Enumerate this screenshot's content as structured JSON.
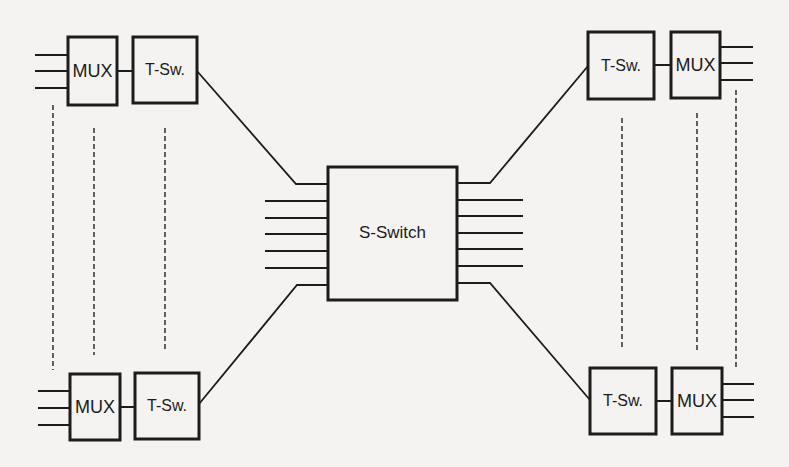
{
  "diagram": {
    "type": "time-space switching network",
    "colors": {
      "background": "#f4f3f1",
      "stroke": "#1c1c1c",
      "dashed": "#3a3a3a"
    },
    "center_switch": {
      "label": "S-Switch",
      "x": 328,
      "y": 167,
      "w": 129,
      "h": 133,
      "left_lines_y": [
        201,
        218,
        234,
        251,
        268
      ],
      "right_lines_y": [
        200,
        216,
        233,
        249,
        266
      ],
      "left_line_x0": 265,
      "right_line_x1": 523
    },
    "stages": [
      {
        "id": "top-left",
        "mux": {
          "label": "MUX",
          "x": 68,
          "y": 37,
          "w": 49,
          "h": 68
        },
        "tsw": {
          "label": "T-Sw.",
          "x": 133,
          "y": 37,
          "w": 64,
          "h": 66
        },
        "io_lines_y": [
          55,
          71,
          88
        ],
        "io_x0": 35,
        "io_x1": 68,
        "link": {
          "points": "197,71 296,184 328,184"
        }
      },
      {
        "id": "top-right",
        "tsw": {
          "label": "T-Sw.",
          "x": 588,
          "y": 32,
          "w": 66,
          "h": 67
        },
        "mux": {
          "label": "MUX",
          "x": 671,
          "y": 32,
          "w": 49,
          "h": 66
        },
        "io_lines_y": [
          47,
          63,
          80
        ],
        "io_x0": 720,
        "io_x1": 753,
        "link": {
          "points": "588,66 490,183 457,183"
        }
      },
      {
        "id": "bottom-left",
        "mux": {
          "label": "MUX",
          "x": 70,
          "y": 374,
          "w": 50,
          "h": 66
        },
        "tsw": {
          "label": "T-Sw.",
          "x": 135,
          "y": 373,
          "w": 64,
          "h": 66
        },
        "io_lines_y": [
          391,
          408,
          425
        ],
        "io_x0": 38,
        "io_x1": 70,
        "link": {
          "points": "199,404 297,285 328,285"
        }
      },
      {
        "id": "bottom-right",
        "tsw": {
          "label": "T-Sw.",
          "x": 590,
          "y": 368,
          "w": 66,
          "h": 66
        },
        "mux": {
          "label": "MUX",
          "x": 672,
          "y": 368,
          "w": 50,
          "h": 66
        },
        "io_lines_y": [
          384,
          400,
          417
        ],
        "io_x0": 722,
        "io_x1": 754,
        "link": {
          "points": "590,400 490,283 457,283"
        }
      }
    ],
    "dashed_lines": [
      {
        "x": 53,
        "y0": 105,
        "y1": 370
      },
      {
        "x": 94,
        "y0": 128,
        "y1": 355
      },
      {
        "x": 165,
        "y0": 128,
        "y1": 352
      },
      {
        "x": 622,
        "y0": 118,
        "y1": 350
      },
      {
        "x": 697,
        "y0": 113,
        "y1": 350
      },
      {
        "x": 736,
        "y0": 90,
        "y1": 367
      }
    ]
  }
}
